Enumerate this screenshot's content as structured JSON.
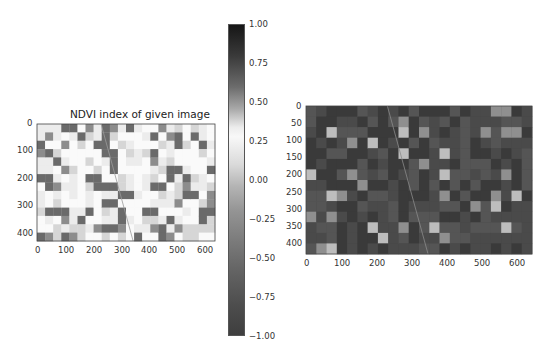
{
  "chart_data": [
    {
      "type": "heatmap",
      "title": "NDVI index of given image",
      "description": "NDVI raster of farmland (grayscale colormap), mostly light with darker square field patches",
      "xlabel": "",
      "ylabel": "",
      "xticks": [
        0,
        100,
        200,
        300,
        400,
        500,
        600
      ],
      "yticks": [
        0,
        100,
        200,
        300,
        400
      ],
      "xlim": [
        0,
        640
      ],
      "ylim": [
        427,
        0
      ],
      "colorbar": {
        "ticks": [
          "1.00",
          "0.75",
          "0.50",
          "0.25",
          "0.00",
          "−0.25",
          "−0.50",
          "−0.75",
          "−1.00"
        ],
        "range": [
          -1.0,
          1.0
        ]
      }
    },
    {
      "type": "heatmap",
      "title": "",
      "description": "Original grayscale satellite image of farmland fields with a diagonal road and scale bar",
      "xlabel": "",
      "ylabel": "",
      "xticks": [
        0,
        100,
        200,
        300,
        400,
        500,
        600
      ],
      "yticks": [
        0,
        50,
        100,
        150,
        200,
        250,
        300,
        350,
        400
      ],
      "xlim": [
        0,
        640
      ],
      "ylim": [
        427,
        0
      ]
    }
  ],
  "left_plot": {
    "title": "NDVI index of given image",
    "xticks": [
      "0",
      "100",
      "200",
      "300",
      "400",
      "500",
      "600"
    ],
    "yticks": [
      "0",
      "100",
      "200",
      "300",
      "400"
    ]
  },
  "colorbar": {
    "ticks": [
      "1.00",
      "0.75",
      "0.50",
      "0.25",
      "0.00",
      "−0.25",
      "−0.50",
      "−0.75",
      "−1.00"
    ]
  },
  "right_plot": {
    "xticks": [
      "0",
      "100",
      "200",
      "300",
      "400",
      "500",
      "600"
    ],
    "yticks": [
      "0",
      "50",
      "100",
      "150",
      "200",
      "250",
      "300",
      "350",
      "400"
    ]
  }
}
